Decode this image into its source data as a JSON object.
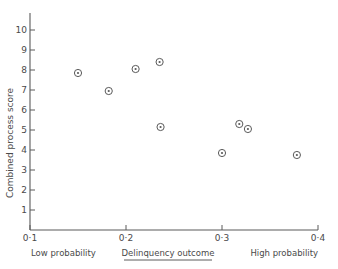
{
  "chart_data": {
    "type": "scatter",
    "title": "",
    "xlabel": "Delinquency outcome",
    "ylabel": "Combined process score",
    "xlim": [
      0.1,
      0.4
    ],
    "ylim": [
      0,
      10.6
    ],
    "grid": false,
    "legend": null,
    "x_ticks": [
      {
        "value": 0.1,
        "label": "0·1"
      },
      {
        "value": 0.2,
        "label": "0·2"
      },
      {
        "value": 0.3,
        "label": "0·3"
      },
      {
        "value": 0.4,
        "label": "0·4"
      }
    ],
    "y_ticks": [
      {
        "value": 1,
        "label": "1"
      },
      {
        "value": 2,
        "label": "2"
      },
      {
        "value": 3,
        "label": "3"
      },
      {
        "value": 4,
        "label": "4"
      },
      {
        "value": 5,
        "label": "5"
      },
      {
        "value": 6,
        "label": "6"
      },
      {
        "value": 7,
        "label": "7"
      },
      {
        "value": 8,
        "label": "8"
      },
      {
        "value": 9,
        "label": "9"
      },
      {
        "value": 10,
        "label": "10"
      }
    ],
    "points": [
      {
        "x": 0.15,
        "y": 7.85
      },
      {
        "x": 0.182,
        "y": 6.95
      },
      {
        "x": 0.21,
        "y": 8.05
      },
      {
        "x": 0.235,
        "y": 8.4
      },
      {
        "x": 0.236,
        "y": 5.15
      },
      {
        "x": 0.3,
        "y": 3.85
      },
      {
        "x": 0.318,
        "y": 5.3
      },
      {
        "x": 0.327,
        "y": 5.05
      },
      {
        "x": 0.378,
        "y": 3.75
      }
    ],
    "marker": "circle-with-dot",
    "marker_color": "#5a5a5a",
    "annotations": {
      "x_axis_left_caption": "Low probability",
      "x_axis_center_caption": "Delinquency outcome",
      "x_axis_right_caption": "High probability"
    }
  },
  "axes": {
    "y_title": "Combined process score",
    "x_left_label": "Low probability",
    "x_center_label": "Delinquency outcome",
    "x_right_label": "High probability"
  },
  "colors": {
    "ink": "#4a4a4a",
    "axis": "#5a5a5a",
    "background": "#ffffff"
  }
}
